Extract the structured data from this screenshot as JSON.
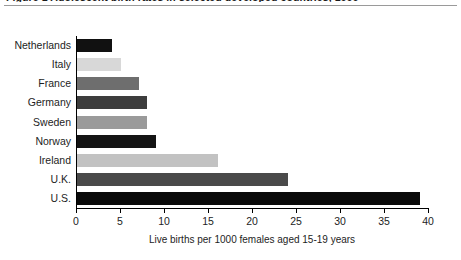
{
  "figure": {
    "clipped_caption": "Figure 1 Adolescent birth rates in selected developed countries, 1996",
    "top_rule": "horizontal-rule"
  },
  "chart_data": {
    "type": "bar",
    "orientation": "horizontal",
    "title": "",
    "xlabel": "Live births per 1000 females aged 15-19 years",
    "ylabel": "",
    "categories": [
      "Netherlands",
      "Italy",
      "France",
      "Germany",
      "Sweden",
      "Norway",
      "Ireland",
      "U.K.",
      "U.S."
    ],
    "values": [
      4,
      5,
      7,
      8,
      8,
      9,
      16,
      24,
      39
    ],
    "bar_colors": [
      "#111111",
      "#d8d8d8",
      "#6e6e6e",
      "#3d3d3d",
      "#9a9a9a",
      "#141414",
      "#c2c2c2",
      "#4a4a4a",
      "#0a0a0a"
    ],
    "xlim": [
      0,
      40
    ],
    "xticks": [
      0,
      5,
      10,
      15,
      20,
      25,
      30,
      35,
      40
    ],
    "xtick_labels": [
      "0",
      "5",
      "10",
      "15",
      "20",
      "25",
      "30",
      "35",
      "40"
    ],
    "grid": false,
    "legend": null
  }
}
